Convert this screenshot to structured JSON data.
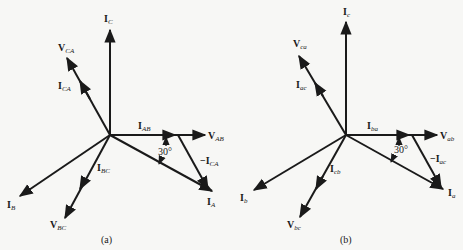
{
  "diagram_a": {
    "caption": "(a)",
    "angle": "30°",
    "labels": {
      "ic_main": "I",
      "ic_sub": "C",
      "vca_main": "V",
      "vca_sub": "CA",
      "ica_main": "I",
      "ica_sub": "CA",
      "iab_main": "I",
      "iab_sub": "AB",
      "vab_main": "V",
      "vab_sub": "AB",
      "nica_main": "−I",
      "nica_sub": "CA",
      "ia_main": "I",
      "ia_sub": "A",
      "ibc_main": "I",
      "ibc_sub": "BC",
      "ib_main": "I",
      "ib_sub": "B",
      "vbc_main": "V",
      "vbc_sub": "BC"
    }
  },
  "diagram_b": {
    "caption": "(b)",
    "angle": "30°",
    "labels": {
      "ic_main": "I",
      "ic_sub": "c",
      "vca_main": "V",
      "vca_sub": "ca",
      "iac_main": "I",
      "iac_sub": "ac",
      "iba_main": "I",
      "iba_sub": "ba",
      "vab_main": "V",
      "vab_sub": "ab",
      "niac_main": "−I",
      "niac_sub": "ac",
      "ia_main": "I",
      "ia_sub": "a",
      "icb_main": "I",
      "icb_sub": "cb",
      "ib_main": "I",
      "ib_sub": "b",
      "vbc_main": "V",
      "vbc_sub": "bc"
    }
  }
}
